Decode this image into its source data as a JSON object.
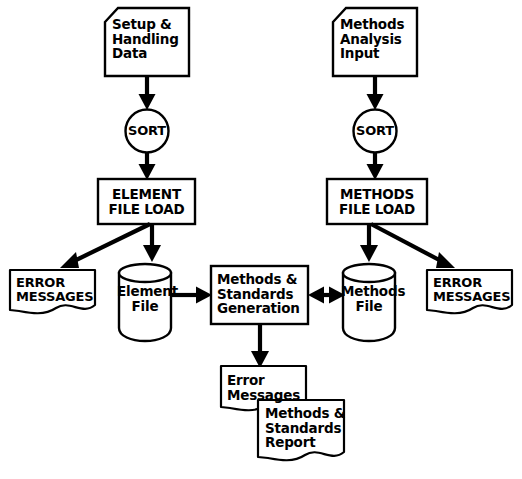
{
  "diagram": {
    "type": "flowchart",
    "background_color": "#ffffff",
    "line_color": "#000000",
    "nodes": [
      {
        "id": "setup-handling-data",
        "shape": "input-card",
        "label": "Setup &\nHandling\nData",
        "column": "left"
      },
      {
        "id": "sort-left",
        "shape": "circle",
        "label": "SORT",
        "column": "left"
      },
      {
        "id": "element-file-load",
        "shape": "process-box",
        "label": "ELEMENT\nFILE LOAD",
        "column": "left"
      },
      {
        "id": "error-messages-left",
        "shape": "document",
        "label": "ERROR\nMESSAGES",
        "column": "left"
      },
      {
        "id": "element-file",
        "shape": "cylinder",
        "label": "Element\nFile",
        "column": "left"
      },
      {
        "id": "methods-standards-generation",
        "shape": "process-box",
        "label": "Methods &\nStandards\nGeneration",
        "column": "center"
      },
      {
        "id": "methods-analysis-input",
        "shape": "input-card",
        "label": "Methods\nAnalysis\nInput",
        "column": "right"
      },
      {
        "id": "sort-right",
        "shape": "circle",
        "label": "SORT",
        "column": "right"
      },
      {
        "id": "methods-file-load",
        "shape": "process-box",
        "label": "METHODS\nFILE LOAD",
        "column": "right"
      },
      {
        "id": "methods-file",
        "shape": "cylinder",
        "label": "Methods\nFile",
        "column": "right"
      },
      {
        "id": "error-messages-right",
        "shape": "document",
        "label": "ERROR\nMESSAGES",
        "column": "right"
      },
      {
        "id": "error-messages-center",
        "shape": "document",
        "label": "Error\nMessages",
        "column": "center"
      },
      {
        "id": "methods-standards-report",
        "shape": "document",
        "label": "Methods &\nStandards\nReport",
        "column": "center"
      }
    ],
    "edges": [
      {
        "from": "setup-handling-data",
        "to": "sort-left",
        "direction": "down"
      },
      {
        "from": "sort-left",
        "to": "element-file-load",
        "direction": "down"
      },
      {
        "from": "element-file-load",
        "to": "error-messages-left",
        "direction": "down-left"
      },
      {
        "from": "element-file-load",
        "to": "element-file",
        "direction": "down"
      },
      {
        "from": "element-file",
        "to": "methods-standards-generation",
        "direction": "right"
      },
      {
        "from": "methods-analysis-input",
        "to": "sort-right",
        "direction": "down"
      },
      {
        "from": "sort-right",
        "to": "methods-file-load",
        "direction": "down"
      },
      {
        "from": "methods-file-load",
        "to": "error-messages-right",
        "direction": "down-right"
      },
      {
        "from": "methods-file-load",
        "to": "methods-file",
        "direction": "down"
      },
      {
        "from": "methods-standards-generation",
        "to": "methods-file",
        "direction": "bidirectional"
      },
      {
        "from": "methods-standards-generation",
        "to": "error-messages-center",
        "direction": "down"
      }
    ],
    "labels": {
      "setup_handling_data": {
        "line1": "Setup &",
        "line2": "Handling",
        "line3": "Data"
      },
      "sort_left": "SORT",
      "element_file_load": {
        "line1": "ELEMENT",
        "line2": "FILE LOAD"
      },
      "error_messages_left": {
        "line1": "ERROR",
        "line2": "MESSAGES"
      },
      "element_file": {
        "line1": "Element",
        "line2": "File"
      },
      "methods_standards_generation": {
        "line1": "Methods &",
        "line2": "Standards",
        "line3": "Generation"
      },
      "methods_analysis_input": {
        "line1": "Methods",
        "line2": "Analysis",
        "line3": "Input"
      },
      "sort_right": "SORT",
      "methods_file_load": {
        "line1": "METHODS",
        "line2": "FILE LOAD"
      },
      "methods_file": {
        "line1": "Methods",
        "line2": "File"
      },
      "error_messages_right": {
        "line1": "ERROR",
        "line2": "MESSAGES"
      },
      "error_messages_center": {
        "line1": "Error",
        "line2": "Messages"
      },
      "methods_standards_report": {
        "line1": "Methods &",
        "line2": "Standards",
        "line3": "Report"
      }
    }
  }
}
